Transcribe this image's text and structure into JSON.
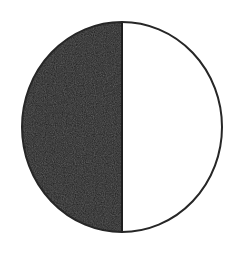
{
  "page": {
    "background_color": "#ffffff",
    "width": 244,
    "height": 259
  },
  "figure": {
    "name": "half-shaded-circle",
    "description": "A circle with a thin dark outline, divided by a vertical diameter; the left half is filled solid near-black and the right half is left white.",
    "shape": "circle",
    "fraction_shaded": "1/2",
    "shaded_side": "left",
    "unshaded_side": "right",
    "outline_color": "#262626",
    "outline_width_px": 2,
    "fill_color": "#1e1e1e",
    "unfilled_color": "#ffffff",
    "center_x": 122,
    "center_y": 127,
    "radius_x": 100,
    "radius_y": 105,
    "divider_x": 122,
    "divider_color": "#1e1e1e",
    "divider_width_px": 2
  },
  "chart_data": {
    "type": "pie",
    "title": "",
    "subtitle": "",
    "xlabel": "",
    "ylabel": "",
    "legend_position": "none",
    "grid": false,
    "labels": [
      "shaded",
      "unshaded"
    ],
    "values": [
      50,
      50
    ],
    "colors": [
      "#1e1e1e",
      "#ffffff"
    ],
    "start_angle_deg": 90,
    "direction": "counterclockwise",
    "annotations": []
  }
}
